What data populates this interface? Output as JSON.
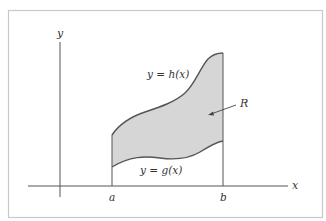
{
  "diagram": {
    "type": "region-between-curves",
    "colors": {
      "background": "#ffffff",
      "frame": "#c8c8c8",
      "axes": "#555555",
      "curve": "#555555",
      "fill": "#d6d6d6",
      "text": "#333333"
    },
    "labels": {
      "y_axis": "y",
      "x_axis": "x",
      "upper_curve": "y = h(x)",
      "lower_curve": "y = g(x)",
      "region": "R",
      "left_bound": "a",
      "right_bound": "b"
    }
  }
}
